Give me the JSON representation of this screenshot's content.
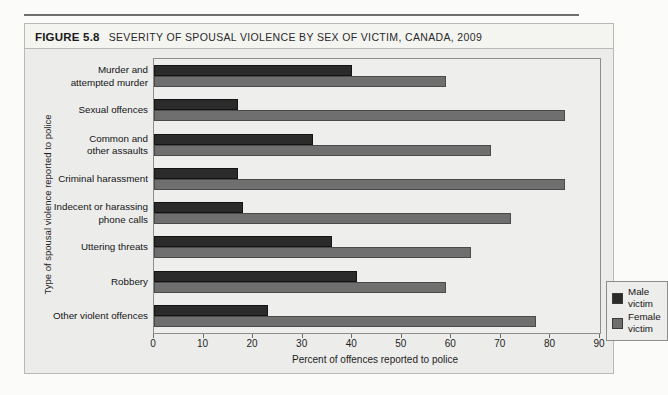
{
  "figure": {
    "number": "FIGURE 5.8",
    "title": "SEVERITY OF SPOUSAL VIOLENCE BY SEX OF VICTIM, CANADA, 2009"
  },
  "legend": {
    "male_label": "Male victim",
    "female_label": "Female victim",
    "male_color": "#2b2b2b",
    "female_color": "#6f6f6f"
  },
  "chart_data": {
    "type": "bar",
    "orientation": "horizontal",
    "title": "SEVERITY OF SPOUSAL VIOLENCE BY SEX OF VICTIM, CANADA, 2009",
    "xlabel": "Percent of offences reported to police",
    "ylabel": "Type of spousal violence reported to police",
    "xlim": [
      0,
      90
    ],
    "xticks": [
      0,
      10,
      20,
      30,
      40,
      50,
      60,
      70,
      80,
      90
    ],
    "grid": false,
    "legend_position": "inside-bottom-right",
    "categories": [
      "Murder and\nattempted murder",
      "Sexual offences",
      "Common and\nother assaults",
      "Criminal harassment",
      "Indecent or harassing\nphone calls",
      "Uttering threats",
      "Robbery",
      "Other violent offences"
    ],
    "series": [
      {
        "name": "Male victim",
        "color": "#2b2b2b",
        "values": [
          40,
          17,
          32,
          17,
          18,
          36,
          41,
          23
        ]
      },
      {
        "name": "Female victim",
        "color": "#6f6f6f",
        "values": [
          59,
          83,
          68,
          83,
          72,
          64,
          59,
          77
        ]
      }
    ]
  }
}
